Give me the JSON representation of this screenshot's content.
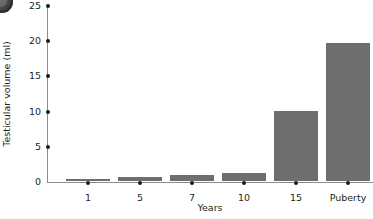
{
  "figure": {
    "badge_name": "corner-badge"
  },
  "chart_data": {
    "type": "bar",
    "title": "",
    "subtitle": "",
    "xlabel": "Years",
    "ylabel": "Testicular volume (ml)",
    "categories": [
      "1",
      "5",
      "7",
      "10",
      "15",
      "Puberty"
    ],
    "values": [
      0.3,
      0.6,
      0.9,
      1.1,
      9.9,
      19.6
    ],
    "series": [
      {
        "name": "Testicular volume",
        "values": [
          0.3,
          0.6,
          0.9,
          1.1,
          9.9,
          19.6
        ]
      }
    ],
    "ylim": [
      0,
      25
    ],
    "yticks": [
      0,
      5,
      10,
      15,
      20,
      25
    ],
    "ytick_labels": [
      "0",
      "5",
      "10",
      "15",
      "20",
      "25"
    ],
    "grid": false,
    "legend": false,
    "legend_position": "none",
    "bar_color": "#6e6e6e",
    "axis_color": "#8c8c8c",
    "tick_marker_color": "#1a1a1a",
    "tick_marker_style": "dot",
    "annotations": []
  }
}
